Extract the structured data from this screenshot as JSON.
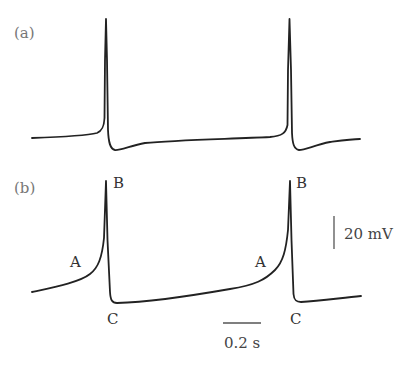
{
  "figure": {
    "panels": [
      {
        "id": "a",
        "label": "(a)",
        "description": "Action potential trace with spikes and after-hyperpolarization"
      },
      {
        "id": "b",
        "label": "(b)",
        "description": "Pacemaker potential trace with slow depolarization"
      }
    ],
    "point_labels": {
      "A1": "A",
      "B1": "B",
      "C1": "C",
      "A2": "A",
      "B2": "B",
      "C2": "C"
    },
    "scale_bars": {
      "voltage": {
        "label": "20 mV",
        "value": 20,
        "unit": "mV"
      },
      "time": {
        "label": "0.2 s",
        "value": 0.2,
        "unit": "s"
      }
    },
    "colors": {
      "trace": "#222222",
      "panel_label": "#777777",
      "text": "#333333"
    }
  }
}
